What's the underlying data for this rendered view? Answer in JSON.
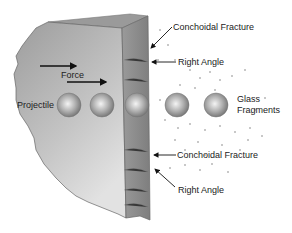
{
  "diagram": {
    "labels": {
      "force": "Force",
      "projectile": "Projectile",
      "glass_fragments_line1": "Glass",
      "glass_fragments_line2": "Fragments",
      "conchoidal_fracture_top": "Conchoidal Fracture",
      "right_angle_top": "Right Angle",
      "conchoidal_fracture_bottom": "Conchoidal Fracture",
      "right_angle_bottom": "Right Angle"
    },
    "projectile_count": 5,
    "colors": {
      "glass_face": "#a8a8a8",
      "glass_edge": "#8c8c8c",
      "glass_top": "#9a9a9a",
      "projectile": "#9e9e9e",
      "text": "#222222"
    }
  }
}
